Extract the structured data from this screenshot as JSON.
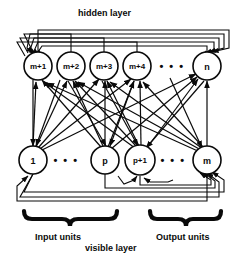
{
  "diagram": {
    "title_top": "hidden layer",
    "title_bottom": "visible layer",
    "group_labels": {
      "input": "Input units",
      "output": "Output units"
    },
    "colors": {
      "stroke": "#0a0a0a",
      "node_fill": "#ffffff",
      "background": "#ffffff"
    },
    "hidden_layer": {
      "name": "hidden layer",
      "nodes": [
        {
          "label": "m+1",
          "cx": 38,
          "cy": 66,
          "r": 14,
          "type": "unit"
        },
        {
          "label": "m+2",
          "cx": 71,
          "cy": 66,
          "r": 14,
          "type": "unit"
        },
        {
          "label": "m+3",
          "cx": 104,
          "cy": 66,
          "r": 14,
          "type": "unit"
        },
        {
          "label": "m+4",
          "cx": 137,
          "cy": 66,
          "r": 14,
          "type": "unit"
        },
        {
          "label": "• • •",
          "cx": 172,
          "cy": 66,
          "r": 0,
          "type": "ellipsis"
        },
        {
          "label": "n",
          "cx": 207,
          "cy": 66,
          "r": 14,
          "type": "unit"
        }
      ]
    },
    "visible_layer": {
      "name": "visible layer",
      "nodes": [
        {
          "label": "1",
          "cx": 33,
          "cy": 160,
          "r": 14,
          "type": "unit",
          "group": "input"
        },
        {
          "label": "• • •",
          "cx": 66,
          "cy": 160,
          "r": 0,
          "type": "ellipsis",
          "group": "input"
        },
        {
          "label": "p",
          "cx": 105,
          "cy": 160,
          "r": 14,
          "type": "unit",
          "group": "input"
        },
        {
          "label": "p+1",
          "cx": 140,
          "cy": 160,
          "r": 15,
          "type": "unit",
          "group": "output"
        },
        {
          "label": "• • •",
          "cx": 173,
          "cy": 160,
          "r": 0,
          "type": "ellipsis",
          "group": "output"
        },
        {
          "label": "m",
          "cx": 207,
          "cy": 160,
          "r": 14,
          "type": "unit",
          "group": "output"
        }
      ]
    },
    "braces": [
      {
        "name": "input-units-brace",
        "x1": 22,
        "x2": 118,
        "y": 212
      },
      {
        "name": "output-units-brace",
        "x1": 148,
        "x2": 222,
        "y": 212
      }
    ],
    "connections": {
      "description": "fully connected bidirectional arrows between visible and hidden layers",
      "hidden_recurrent_loops": 4,
      "visible_recurrent_loops": 4
    }
  }
}
